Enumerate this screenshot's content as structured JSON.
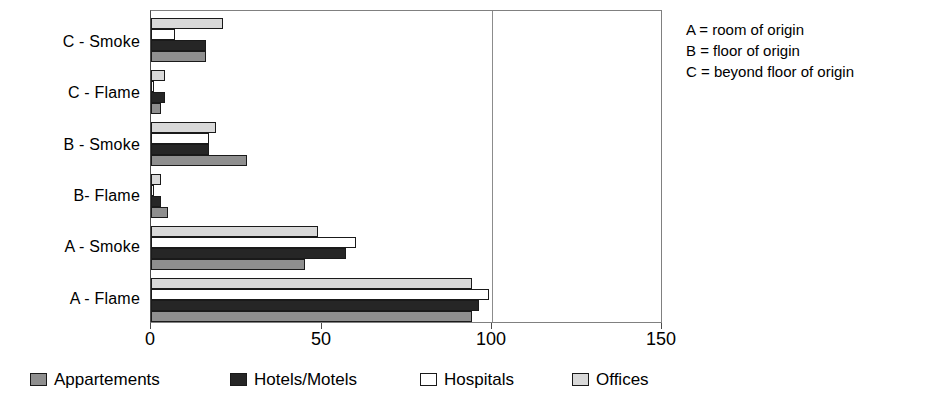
{
  "chart_data": {
    "type": "bar",
    "orientation": "horizontal",
    "title": "",
    "xlabel": "",
    "ylabel": "",
    "xlim": [
      0,
      150
    ],
    "xticks": [
      0,
      50,
      100,
      150
    ],
    "xtick_labels": [
      "0",
      "50",
      "100",
      "150"
    ],
    "grid": true,
    "gridlines_at": [
      100
    ],
    "legend_position": "bottom",
    "categories": [
      "A - Flame",
      "A - Smoke",
      "B- Flame",
      "B - Smoke",
      "C - Flame",
      "C - Smoke"
    ],
    "series": [
      {
        "name": "Appartements",
        "color": "#8f8f8f",
        "values": [
          94,
          45,
          5,
          28,
          3,
          16
        ]
      },
      {
        "name": "Hotels/Motels",
        "color": "#262626",
        "values": [
          96,
          57,
          3,
          17,
          4,
          16
        ]
      },
      {
        "name": "Hospitals",
        "color": "#ffffff",
        "values": [
          99,
          60,
          1,
          17,
          1,
          7
        ]
      },
      {
        "name": "Offices",
        "color": "#d9d9d9",
        "values": [
          94,
          49,
          3,
          19,
          4,
          21
        ]
      }
    ],
    "annotations": [
      "A = room of origin",
      "B = floor of origin",
      "C = beyond floor of origin"
    ]
  },
  "legend": {
    "items": [
      {
        "label": "Appartements",
        "swatch": "appartements"
      },
      {
        "label": "Hotels/Motels",
        "swatch": "hotels"
      },
      {
        "label": "Hospitals",
        "swatch": "hospitals"
      },
      {
        "label": "Offices",
        "swatch": "offices"
      }
    ]
  },
  "key_lines": {
    "a": "A = room of origin",
    "b": "B = floor of origin",
    "c": "C = beyond floor of origin"
  }
}
